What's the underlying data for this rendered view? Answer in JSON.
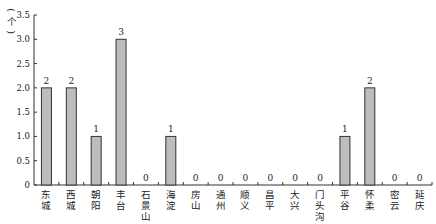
{
  "chart_data": {
    "type": "bar",
    "title": "",
    "xlabel": "",
    "ylabel": "（个）",
    "ylim": [
      0,
      3.5
    ],
    "yticks": [
      "0",
      "0.5",
      "1.0",
      "1.5",
      "2.0",
      "2.5",
      "3.0",
      "3.5"
    ],
    "grid": false,
    "legend": null,
    "categories": [
      "东城",
      "西城",
      "朝阳",
      "丰台",
      "石景山",
      "海淀",
      "房山",
      "通州",
      "顺义",
      "昌平",
      "大兴",
      "门头沟",
      "平谷",
      "怀柔",
      "密云",
      "延庆"
    ],
    "values": [
      2,
      2,
      1,
      3,
      0,
      1,
      0,
      0,
      0,
      0,
      0,
      0,
      1,
      2,
      0,
      0
    ],
    "data_labels": [
      "2",
      "2",
      "1",
      "3",
      "0",
      "1",
      "0",
      "0",
      "0",
      "0",
      "0",
      "0",
      "1",
      "2",
      "0",
      "0"
    ],
    "colors": {
      "bar_fill": "#bdbdbd",
      "bar_stroke": "#333333",
      "axis": "#333333"
    }
  }
}
